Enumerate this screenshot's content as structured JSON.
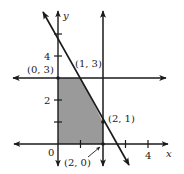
{
  "figure": {
    "type": "feasible-region-graph",
    "axes": {
      "x_label": "x",
      "y_label": "y",
      "x_ticks": [
        {
          "value": 0,
          "label": "0"
        },
        {
          "value": 1,
          "label": ""
        },
        {
          "value": 2,
          "label": ""
        },
        {
          "value": 3,
          "label": ""
        },
        {
          "value": 4,
          "label": "4"
        }
      ],
      "y_ticks": [
        {
          "value": 1,
          "label": ""
        },
        {
          "value": 2,
          "label": "2"
        },
        {
          "value": 3,
          "label": ""
        },
        {
          "value": 4,
          "label": "4"
        },
        {
          "value": 5,
          "label": ""
        }
      ],
      "origin_label": "0"
    },
    "lines": [
      {
        "name": "y = 3",
        "equation": "y = 3"
      },
      {
        "name": "x = 2",
        "equation": "x = 2"
      },
      {
        "name": "2x + y = 5",
        "equation": "2x + y = 5"
      }
    ],
    "vertices": [
      {
        "label": "(0, 3)",
        "x": 0,
        "y": 3
      },
      {
        "label": "(1, 3)",
        "x": 1,
        "y": 3
      },
      {
        "label": "(2, 1)",
        "x": 2,
        "y": 1
      },
      {
        "label": "(2, 0)",
        "x": 2,
        "y": 0
      }
    ],
    "shaded_region": {
      "description": "feasible region",
      "polygon": [
        [
          0,
          0
        ],
        [
          0,
          3
        ],
        [
          1,
          3
        ],
        [
          2,
          1
        ],
        [
          2,
          0
        ]
      ],
      "color": "#9a9a9a"
    },
    "colors": {
      "line": "#1a1a1a",
      "fill": "#9a9a9a",
      "background": "#ffffff"
    }
  }
}
